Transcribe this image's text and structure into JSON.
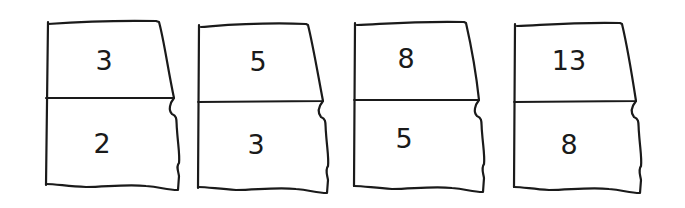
{
  "diagram": {
    "stroke_color": "#1a1a1a",
    "background": "#ffffff",
    "panels": [
      {
        "top_label": "3",
        "bottom_label": "2"
      },
      {
        "top_label": "5",
        "bottom_label": "3"
      },
      {
        "top_label": "8",
        "bottom_label": "5"
      },
      {
        "top_label": "13",
        "bottom_label": "8"
      }
    ]
  }
}
